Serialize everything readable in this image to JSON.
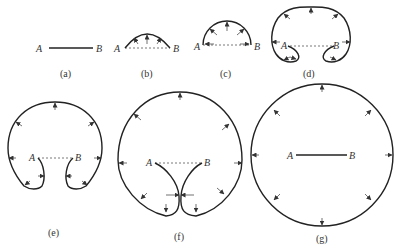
{
  "figure": {
    "panels": [
      {
        "id": "a",
        "caption": "(a)",
        "label_a": "A",
        "label_b": "B"
      },
      {
        "id": "b",
        "caption": "(b)",
        "label_a": "A",
        "label_b": "B"
      },
      {
        "id": "c",
        "caption": "(c)",
        "label_a": "A",
        "label_b": "B"
      },
      {
        "id": "d",
        "caption": "(d)",
        "label_a": "A",
        "label_b": "B"
      },
      {
        "id": "e",
        "caption": "(e)",
        "label_a": "A",
        "label_b": "B"
      },
      {
        "id": "f",
        "caption": "(f)",
        "label_a": "A",
        "label_b": "B"
      },
      {
        "id": "g",
        "caption": "(g)",
        "label_a": "A",
        "label_b": "B"
      }
    ]
  },
  "colors": {
    "stroke": "#222222",
    "background": "#ffffff"
  }
}
